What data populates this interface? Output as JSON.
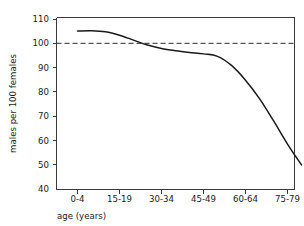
{
  "chart_data": {
    "type": "line",
    "title": "",
    "subtitle": "",
    "xlabel": "age (years)",
    "ylabel": "males per 100 females",
    "grid": false,
    "legend": "none",
    "xlim": [
      0,
      17
    ],
    "ylim": [
      40,
      110
    ],
    "yticks": [
      40,
      50,
      60,
      70,
      80,
      90,
      100,
      110
    ],
    "ytick_labels": [
      "40",
      "50",
      "60",
      "70",
      "80",
      "90",
      "100",
      "110"
    ],
    "xtick_labels": [
      "0-4",
      "15-19",
      "30-34",
      "45-49",
      "60-64",
      "75-79"
    ],
    "xtick_index": [
      0,
      3,
      6,
      9,
      12,
      15
    ],
    "categories": [
      "0-4",
      "5-9",
      "10-14",
      "15-19",
      "20-24",
      "25-29",
      "30-34",
      "35-39",
      "40-44",
      "45-49",
      "50-54",
      "55-59",
      "60-64",
      "65-69",
      "70-74",
      "75-79",
      "80+"
    ],
    "values": [
      104.5,
      104.6,
      104.2,
      102.8,
      100.8,
      98.8,
      97.4,
      96.5,
      95.8,
      95.2,
      94.2,
      90.5,
      84.5,
      77.0,
      68.0,
      58.5,
      50.0
    ],
    "annotations": [
      {
        "name": "parity-reference-line",
        "type": "hline",
        "value": 100,
        "style": "dashed",
        "label": ""
      }
    ],
    "series": [
      {
        "name": "sex ratio",
        "values": [
          104.5,
          104.6,
          104.2,
          102.8,
          100.8,
          98.8,
          97.4,
          96.5,
          95.8,
          95.2,
          94.2,
          90.5,
          84.5,
          77.0,
          68.0,
          58.5,
          50.0
        ]
      }
    ],
    "colors": {
      "curve": "#1a1a1a",
      "reference_line": "#2b2b2b",
      "axis": "#3a3a3a",
      "background": "#ffffff"
    }
  }
}
